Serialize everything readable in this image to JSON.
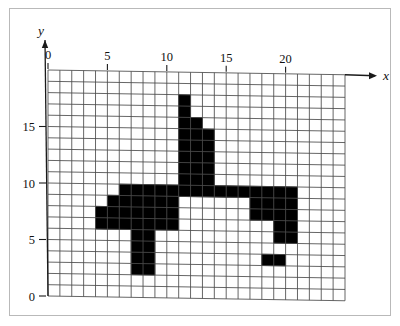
{
  "figure": {
    "type": "pixel-grid-plot",
    "axes": {
      "x_axis_label": "x",
      "y_axis_label": "y",
      "x_ticks": [
        "0",
        "5",
        "10",
        "15",
        "20"
      ],
      "x_tick_values": [
        0,
        5,
        10,
        15,
        20
      ],
      "y_ticks": [
        "0",
        "5",
        "10",
        "15"
      ],
      "y_tick_values": [
        0,
        5,
        10,
        15
      ],
      "x_range": [
        0,
        25
      ],
      "y_range": [
        0,
        20
      ],
      "grid": "on",
      "grid_step": 1
    },
    "colors": {
      "fill": "#000000",
      "grid_line": "#4a4a4a",
      "axis_line": "#1a1a1a",
      "background": "#ffffff",
      "frame": "#b9b9b9"
    }
  },
  "chart_data": {
    "type": "heatmap",
    "title": "",
    "xlabel": "x",
    "ylabel": "y",
    "xlim": [
      0,
      25
    ],
    "ylim": [
      0,
      20
    ],
    "grid": true,
    "cell_size": 1,
    "filled_cells": [
      [
        11,
        16
      ],
      [
        11,
        17
      ],
      [
        11,
        15
      ],
      [
        12,
        15
      ],
      [
        11,
        14
      ],
      [
        12,
        14
      ],
      [
        13,
        14
      ],
      [
        11,
        13
      ],
      [
        12,
        13
      ],
      [
        13,
        13
      ],
      [
        11,
        12
      ],
      [
        12,
        12
      ],
      [
        13,
        12
      ],
      [
        11,
        11
      ],
      [
        12,
        11
      ],
      [
        13,
        11
      ],
      [
        11,
        10
      ],
      [
        12,
        10
      ],
      [
        13,
        10
      ],
      [
        6,
        9
      ],
      [
        7,
        9
      ],
      [
        8,
        9
      ],
      [
        9,
        9
      ],
      [
        10,
        9
      ],
      [
        11,
        9
      ],
      [
        12,
        9
      ],
      [
        13,
        9
      ],
      [
        14,
        9
      ],
      [
        15,
        9
      ],
      [
        16,
        9
      ],
      [
        17,
        9
      ],
      [
        18,
        9
      ],
      [
        19,
        9
      ],
      [
        20,
        9
      ],
      [
        5,
        8
      ],
      [
        6,
        8
      ],
      [
        7,
        8
      ],
      [
        8,
        8
      ],
      [
        9,
        8
      ],
      [
        10,
        8
      ],
      [
        17,
        8
      ],
      [
        18,
        8
      ],
      [
        19,
        8
      ],
      [
        20,
        8
      ],
      [
        4,
        7
      ],
      [
        5,
        7
      ],
      [
        6,
        7
      ],
      [
        7,
        7
      ],
      [
        8,
        7
      ],
      [
        9,
        7
      ],
      [
        10,
        7
      ],
      [
        17,
        7
      ],
      [
        18,
        7
      ],
      [
        19,
        7
      ],
      [
        20,
        7
      ],
      [
        4,
        6
      ],
      [
        5,
        6
      ],
      [
        6,
        6
      ],
      [
        7,
        6
      ],
      [
        8,
        6
      ],
      [
        9,
        6
      ],
      [
        10,
        6
      ],
      [
        19,
        6
      ],
      [
        20,
        6
      ],
      [
        7,
        5
      ],
      [
        8,
        5
      ],
      [
        19,
        5
      ],
      [
        20,
        5
      ],
      [
        7,
        4
      ],
      [
        8,
        4
      ],
      [
        7,
        3
      ],
      [
        8,
        3
      ],
      [
        18,
        3
      ],
      [
        19,
        3
      ],
      [
        7,
        2
      ],
      [
        8,
        2
      ]
    ]
  }
}
